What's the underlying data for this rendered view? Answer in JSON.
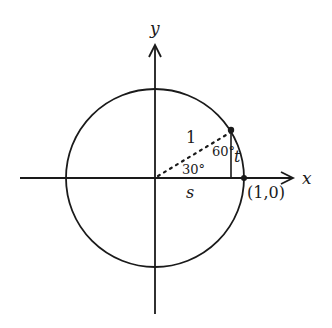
{
  "diagram": {
    "axes": {
      "x_label": "x",
      "y_label": "y"
    },
    "labels": {
      "hypotenuse": "1",
      "angle_at_origin": "30°",
      "angle_at_point": "60°",
      "vertical_leg": "t",
      "horizontal_leg": "s",
      "point_on_axis": "(1,0)"
    },
    "colors": {
      "stroke": "#1a1a1a",
      "background": "#ffffff"
    }
  }
}
